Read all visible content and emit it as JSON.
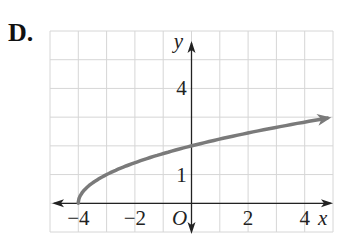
{
  "problem_label": "D.",
  "chart_data": {
    "type": "line",
    "title": "",
    "xlabel": "x",
    "ylabel": "y",
    "function": "y = sqrt(x + 4)",
    "xlim": [
      -5,
      5
    ],
    "ylim": [
      -1,
      6
    ],
    "grid": true,
    "x_tick_labels": [
      {
        "value": -4,
        "label": "−4"
      },
      {
        "value": -2,
        "label": "−2"
      },
      {
        "value": 0,
        "label": "O"
      },
      {
        "value": 2,
        "label": "2"
      },
      {
        "value": 4,
        "label": "4"
      }
    ],
    "y_tick_labels": [
      {
        "value": 1,
        "label": "1"
      },
      {
        "value": 4,
        "label": "4"
      }
    ],
    "series": [
      {
        "name": "y = sqrt(x+4)",
        "color": "#7a7a7a",
        "start_point": [
          -4,
          0
        ],
        "end_arrow": true,
        "x": [
          -4,
          -3.75,
          -3.5,
          -3,
          -2,
          -1,
          0,
          1,
          2,
          3,
          4,
          4.8
        ],
        "y": [
          0,
          0.5,
          0.71,
          1,
          1.41,
          1.73,
          2,
          2.24,
          2.45,
          2.65,
          2.83,
          2.97
        ]
      }
    ]
  }
}
